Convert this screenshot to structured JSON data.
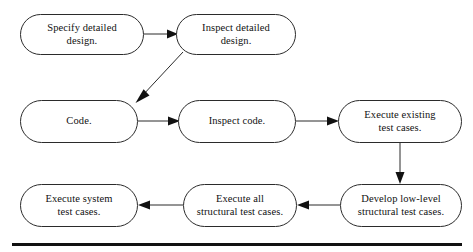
{
  "diagram": {
    "type": "flowchart",
    "background_color": "#ffffff",
    "line_color": "#2b2b2b",
    "text_color": "#111111",
    "nodes": [
      {
        "id": "specify-detailed-design",
        "label": "Specify detailed\ndesign.",
        "row": 1,
        "x": 20,
        "y": 14,
        "w": 124,
        "h": 41
      },
      {
        "id": "inspect-detailed-design",
        "label": "Inspect detailed\ndesign.",
        "row": 1,
        "x": 176,
        "y": 14,
        "w": 120,
        "h": 41
      },
      {
        "id": "code",
        "label": "Code.",
        "row": 2,
        "x": 20,
        "y": 100,
        "w": 118,
        "h": 43
      },
      {
        "id": "inspect-code",
        "label": "Inspect code.",
        "row": 2,
        "x": 178,
        "y": 100,
        "w": 118,
        "h": 43
      },
      {
        "id": "execute-existing-test-cases",
        "label": "Execute existing\ntest cases.",
        "row": 2,
        "x": 338,
        "y": 100,
        "w": 124,
        "h": 43
      },
      {
        "id": "execute-system-test-cases",
        "label": "Execute system\ntest cases.",
        "row": 3,
        "x": 20,
        "y": 184,
        "w": 118,
        "h": 43
      },
      {
        "id": "execute-all-structural-test-cases",
        "label": "Execute all\nstructural test cases.",
        "row": 3,
        "x": 183,
        "y": 184,
        "w": 114,
        "h": 43
      },
      {
        "id": "develop-low-level-structural-test-cases",
        "label": "Develop low-level\nstructural test cases.",
        "row": 3,
        "x": 340,
        "y": 184,
        "w": 122,
        "h": 43
      }
    ],
    "edges": [
      {
        "id": "edge-specify-to-inspect-design",
        "from": "specify-detailed-design",
        "to": "inspect-detailed-design",
        "direction": "right"
      },
      {
        "id": "edge-inspect-design-to-code",
        "from": "inspect-detailed-design",
        "to": "code",
        "direction": "diagonal-down-left"
      },
      {
        "id": "edge-code-to-inspect-code",
        "from": "code",
        "to": "inspect-code",
        "direction": "right"
      },
      {
        "id": "edge-inspect-code-to-execute-existing",
        "from": "inspect-code",
        "to": "execute-existing-test-cases",
        "direction": "right"
      },
      {
        "id": "edge-execute-existing-to-develop-low-level",
        "from": "execute-existing-test-cases",
        "to": "develop-low-level-structural-test-cases",
        "direction": "down"
      },
      {
        "id": "edge-develop-low-level-to-execute-all",
        "from": "develop-low-level-structural-test-cases",
        "to": "execute-all-structural-test-cases",
        "direction": "left"
      },
      {
        "id": "edge-execute-all-to-execute-system",
        "from": "execute-all-structural-test-cases",
        "to": "execute-system-test-cases",
        "direction": "left"
      }
    ],
    "bottom_rule": {
      "id": "page-bottom-rule",
      "visible": true
    }
  }
}
